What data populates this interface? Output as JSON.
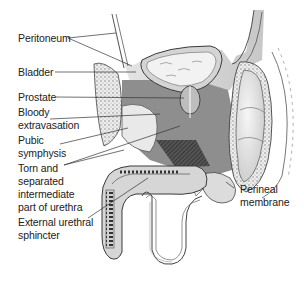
{
  "diagram": {
    "colors": {
      "background": "#ffffff",
      "peritoneum_shade": "#c8c8c8",
      "extravasation_dark": "#8a8a8a",
      "tissue_light": "#e6e6e6",
      "outline": "#3a3a3a",
      "text": "#222222"
    },
    "labels": [
      {
        "id": "peritoneum",
        "text": "Peritoneum"
      },
      {
        "id": "bladder",
        "text": "Bladder"
      },
      {
        "id": "prostate",
        "text": "Prostate"
      },
      {
        "id": "bloody_extravasation_l1",
        "text": "Bloody"
      },
      {
        "id": "bloody_extravasation_l2",
        "text": "extravasation"
      },
      {
        "id": "pubic_symphysis_l1",
        "text": "Pubic"
      },
      {
        "id": "pubic_symphysis_l2",
        "text": "symphysis"
      },
      {
        "id": "torn_urethra_l1",
        "text": "Torn and"
      },
      {
        "id": "torn_urethra_l2",
        "text": "separated"
      },
      {
        "id": "torn_urethra_l3",
        "text": "intermediate"
      },
      {
        "id": "torn_urethra_l4",
        "text": "part of urethra"
      },
      {
        "id": "external_sphincter_l1",
        "text": "External urethral"
      },
      {
        "id": "external_sphincter_l2",
        "text": "sphincter"
      },
      {
        "id": "perineal_membrane_l1",
        "text": "Perineal"
      },
      {
        "id": "perineal_membrane_l2",
        "text": "membrane"
      }
    ]
  }
}
